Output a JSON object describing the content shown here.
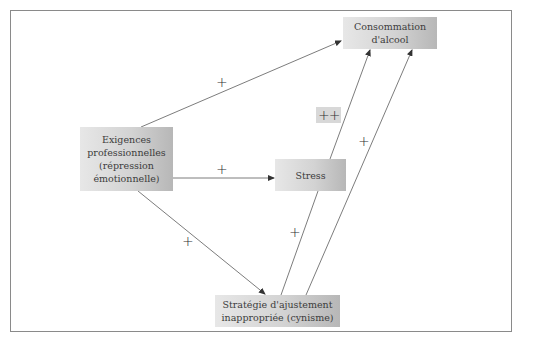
{
  "diagram": {
    "type": "path-diagram",
    "nodes": {
      "alcohol": {
        "lines": [
          "Consommation",
          "d'alcool"
        ]
      },
      "demands": {
        "lines": [
          "Exigences",
          "professionnelles",
          "(répression",
          "émotionnelle)"
        ]
      },
      "stress": {
        "lines": [
          "Stress"
        ]
      },
      "coping": {
        "lines": [
          "Stratégie d'ajustement",
          "inappropriée (cynisme)"
        ]
      }
    },
    "edges": [
      {
        "from": "demands",
        "to": "alcohol",
        "label": "+"
      },
      {
        "from": "demands",
        "to": "stress",
        "label": "+"
      },
      {
        "from": "demands",
        "to": "coping",
        "label": "+"
      },
      {
        "from": "stress",
        "to": "alcohol",
        "label": "++"
      },
      {
        "from": "coping",
        "to": "stress",
        "label": "+"
      },
      {
        "from": "coping",
        "to": "alcohol",
        "label": "+"
      }
    ],
    "colors": {
      "frame": "#8a8a8a",
      "node_light": "#e7e7e7",
      "node_dark": "#b7b7b7",
      "line": "#555555",
      "highlight": "#d8d8d8"
    }
  }
}
